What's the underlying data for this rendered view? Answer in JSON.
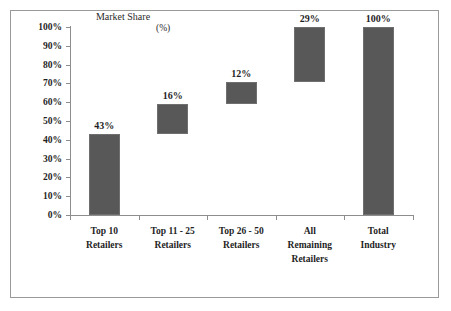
{
  "chart_data": {
    "type": "bar",
    "subtype": "waterfall",
    "title": "Market Share",
    "title_unit": "(%)",
    "xlabel": "",
    "ylabel": "",
    "ylim": [
      0,
      100
    ],
    "grid": false,
    "legend": null,
    "categories": [
      "Top 10 Retailers",
      "Top 11 - 25 Retailers",
      "Top 26 - 50 Retailers",
      "All Remaining Retailers",
      "Total Industry"
    ],
    "category_lines": [
      [
        "Top 10",
        "Retailers"
      ],
      [
        "Top 11 - 25",
        "Retailers"
      ],
      [
        "Top 26 - 50",
        "Retailers"
      ],
      [
        "All",
        "Remaining",
        "Retailers"
      ],
      [
        "Total",
        "Industry"
      ]
    ],
    "values": [
      43,
      16,
      12,
      29,
      100
    ],
    "value_labels": [
      "43%",
      "16%",
      "12%",
      "29%",
      "100%"
    ],
    "bar_base": [
      0,
      43,
      59,
      71,
      0
    ],
    "bar_top": [
      43,
      59,
      71,
      100,
      100
    ],
    "y_ticks": [
      0,
      10,
      20,
      30,
      40,
      50,
      60,
      70,
      80,
      90,
      100
    ],
    "y_tick_labels": [
      "0%",
      "10%",
      "20%",
      "30%",
      "40%",
      "50%",
      "60%",
      "70%",
      "80%",
      "90%",
      "100%"
    ],
    "bar_color": "#585858",
    "axis_color": "#8d8d8d",
    "text_color": "#1f1f1f",
    "background": "#ffffff"
  }
}
